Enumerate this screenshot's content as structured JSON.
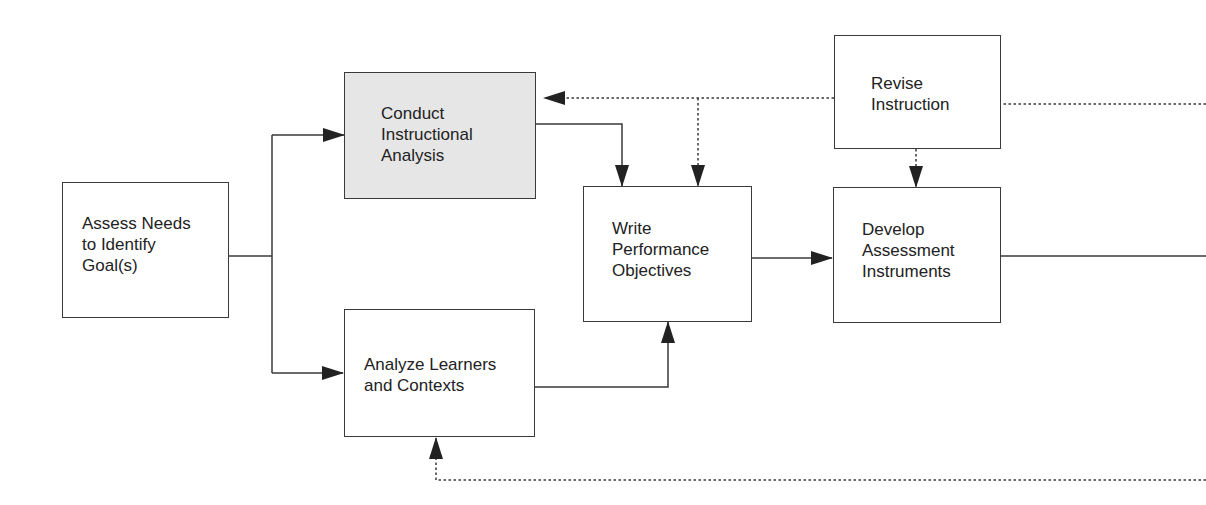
{
  "diagram": {
    "type": "instructional-design-flowchart",
    "colors": {
      "line": "#3a3a3a",
      "shaded_box": "#e6e6e6",
      "text": "#222222"
    },
    "nodes": [
      {
        "id": "assess",
        "label": "Assess Needs\nto Identify\nGoal(s)",
        "shaded": false
      },
      {
        "id": "conduct",
        "label": "Conduct\nInstructional\nAnalysis",
        "shaded": true
      },
      {
        "id": "analyze",
        "label": "Analyze Learners\nand Contexts",
        "shaded": false
      },
      {
        "id": "write",
        "label": "Write\nPerformance\nObjectives",
        "shaded": false
      },
      {
        "id": "develop",
        "label": "Develop\nAssessment\nInstruments",
        "shaded": false
      },
      {
        "id": "revise",
        "label": "Revise\nInstruction",
        "shaded": false
      }
    ],
    "edges": [
      {
        "from": "assess",
        "to": "conduct",
        "style": "solid"
      },
      {
        "from": "assess",
        "to": "analyze",
        "style": "solid"
      },
      {
        "from": "conduct",
        "to": "write",
        "style": "solid"
      },
      {
        "from": "analyze",
        "to": "write",
        "style": "solid"
      },
      {
        "from": "write",
        "to": "develop",
        "style": "solid"
      },
      {
        "from": "develop",
        "to": "offscreen-right",
        "style": "solid"
      },
      {
        "from": "revise",
        "to": "conduct",
        "style": "dotted"
      },
      {
        "from": "revise",
        "to": "write",
        "style": "dotted"
      },
      {
        "from": "revise",
        "to": "develop",
        "style": "dotted"
      },
      {
        "from": "offscreen-right",
        "to": "revise",
        "style": "dotted"
      },
      {
        "from": "offscreen-right",
        "to": "analyze",
        "style": "dotted"
      }
    ]
  }
}
